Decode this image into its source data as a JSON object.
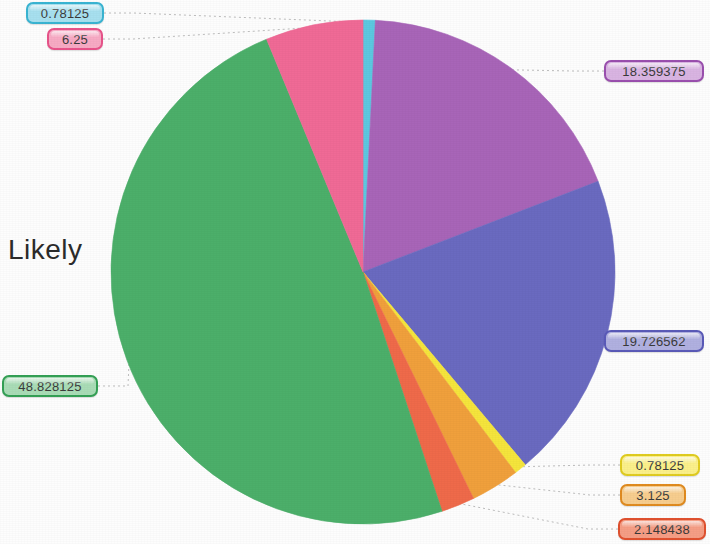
{
  "axis_label": "Likely",
  "chart_data": {
    "type": "pie",
    "title": "",
    "xlabel": "",
    "ylabel": "Likely",
    "legend": "none",
    "start_angle_deg": -90,
    "direction": "clockwise",
    "total": 100.0,
    "center": {
      "cx": 363,
      "cy": 272,
      "r": 252
    },
    "categories": [
      "slice-cyan",
      "slice-purple",
      "slice-blue",
      "slice-yellow",
      "slice-orange",
      "slice-red",
      "slice-green",
      "slice-pink"
    ],
    "values": [
      0.78125,
      18.359375,
      19.726562,
      0.78125,
      3.125,
      2.148438,
      48.828125,
      6.25
    ],
    "labels": [
      "0.78125",
      "18.359375",
      "19.726562",
      "0.78125",
      "3.125",
      "2.148438",
      "48.828125",
      "6.25"
    ],
    "colors": [
      "#5cc8e0",
      "#a865b8",
      "#6a6ac0",
      "#f5e53c",
      "#f0a03c",
      "#ef6a4a",
      "#4caf6a",
      "#f06a96"
    ],
    "label_fills": [
      "#a7e0ef",
      "#d9b4e2",
      "#b0b0e0",
      "#fbf08a",
      "#f7cd8e",
      "#f59e85",
      "#a9dcb6",
      "#f7aac4"
    ],
    "label_borders": [
      "#39b4d2",
      "#9a4fae",
      "#5a5ab8",
      "#e0cc20",
      "#e08b20",
      "#e0512f",
      "#34a055",
      "#e8538a"
    ]
  },
  "callouts": [
    {
      "text": "0.78125",
      "name": "callout-cyan"
    },
    {
      "text": "6.25",
      "name": "callout-pink"
    },
    {
      "text": "18.359375",
      "name": "callout-purple"
    },
    {
      "text": "19.726562",
      "name": "callout-blue"
    },
    {
      "text": "0.78125",
      "name": "callout-yellow"
    },
    {
      "text": "3.125",
      "name": "callout-orange"
    },
    {
      "text": "2.148438",
      "name": "callout-red"
    },
    {
      "text": "48.828125",
      "name": "callout-green"
    }
  ]
}
